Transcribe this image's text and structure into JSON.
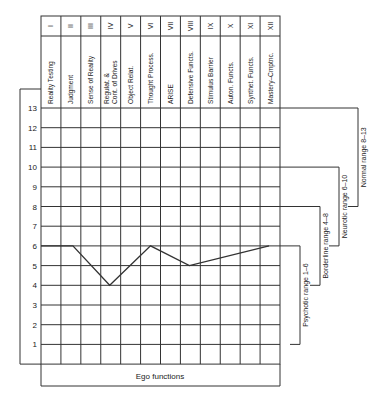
{
  "chart_data": {
    "type": "line",
    "title": "",
    "xlabel": "Ego functions",
    "ylabel": "",
    "ylim": [
      0,
      13
    ],
    "yticks": [
      1,
      2,
      3,
      4,
      5,
      6,
      7,
      8,
      9,
      10,
      11,
      12,
      13
    ],
    "grid": true,
    "categories": [
      {
        "numeral": "I",
        "name": "Reality Testing"
      },
      {
        "numeral": "II",
        "name": "Judgment"
      },
      {
        "numeral": "III",
        "name": "Sense of Reality"
      },
      {
        "numeral": "IV",
        "name": "Regulat. & Cont. of Drives"
      },
      {
        "numeral": "V",
        "name": "Object Relat."
      },
      {
        "numeral": "VI",
        "name": "Thought Process."
      },
      {
        "numeral": "VII",
        "name": "ARISE"
      },
      {
        "numeral": "VIII",
        "name": "Defensive Functs."
      },
      {
        "numeral": "IX",
        "name": "Stimulus Barrier"
      },
      {
        "numeral": "X",
        "name": "Auton. Functs."
      },
      {
        "numeral": "XI",
        "name": "Synthet. Functs."
      },
      {
        "numeral": "XII",
        "name": "Mastery–Cmptnc."
      }
    ],
    "series": [
      {
        "name": "Ego function profile",
        "points": [
          {
            "x": 0.0,
            "y": 6
          },
          {
            "x": 1.6,
            "y": 6
          },
          {
            "x": 3.45,
            "y": 4
          },
          {
            "x": 5.5,
            "y": 6
          },
          {
            "x": 7.45,
            "y": 5
          },
          {
            "x": 11.45,
            "y": 6
          }
        ]
      }
    ],
    "ranges": [
      {
        "label": "Normal range 8–13",
        "from": 8,
        "to": 13
      },
      {
        "label": "Neurotic range 6–10",
        "from": 6,
        "to": 10
      },
      {
        "label": "Borderline range 4–8",
        "from": 4,
        "to": 8
      },
      {
        "label": "Psychotic range 1–6",
        "from": 1,
        "to": 6
      }
    ]
  }
}
